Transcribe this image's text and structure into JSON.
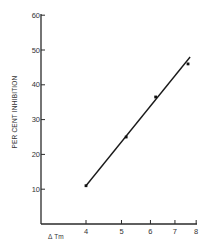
{
  "chart_data": {
    "type": "scatter",
    "title": "",
    "xlabel": "Δ Tm",
    "ylabel": "PER CENT INHIBITION",
    "x_scale": "log",
    "xlim": [
      4,
      8
    ],
    "ylim": [
      0,
      60
    ],
    "x_ticks": [
      "4",
      "5",
      "6",
      "7",
      "8"
    ],
    "y_ticks": [
      "10",
      "20",
      "30",
      "40",
      "50",
      "60"
    ],
    "grid": false,
    "legend": null,
    "series": [
      {
        "name": "data",
        "x": [
          4.0,
          5.15,
          6.2,
          7.6
        ],
        "y": [
          11,
          25,
          36.5,
          46
        ]
      }
    ],
    "fit_line": {
      "type": "linear",
      "from": {
        "x": 4.0,
        "y": 11
      },
      "to": {
        "x": 7.7,
        "y": 48
      }
    }
  }
}
